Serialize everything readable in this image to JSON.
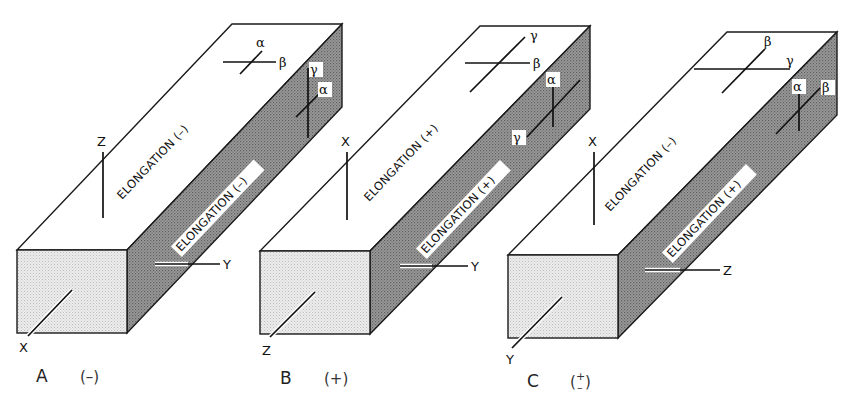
{
  "figure": {
    "colors": {
      "front_face": "#e4e4e4",
      "side_face": "#8c8c8c",
      "top_face": "#ffffff",
      "line": "#1a1a1a"
    },
    "panels": [
      {
        "id": "A",
        "caption": "A",
        "sign": "(–)",
        "front_axis": "X",
        "vertical_axis": "Z",
        "side_axis": "Y",
        "top_face_text": "ELONGATION (–)",
        "side_face_text": "ELONGATION (–)",
        "top_indicatrix": {
          "long_label": "β",
          "short_label": "α"
        },
        "side_indicatrix": {
          "long_label": "γ",
          "short_label": "α"
        }
      },
      {
        "id": "B",
        "caption": "B",
        "sign": "(+)",
        "front_axis": "Z",
        "vertical_axis": "X",
        "side_axis": "Y",
        "top_face_text": "ELONGATION (+)",
        "side_face_text": "ELONGATION (+)",
        "top_indicatrix": {
          "long_label": "γ",
          "short_label": "β"
        },
        "side_indicatrix": {
          "long_label": "γ",
          "short_label": "α"
        }
      },
      {
        "id": "C",
        "caption": "C",
        "sign_top": "+",
        "sign_bottom": "–",
        "front_axis": "Y",
        "vertical_axis": "X",
        "side_axis": "Z",
        "top_face_text": "ELONGATION (–)",
        "side_face_text": "ELONGATION (+)",
        "top_indicatrix": {
          "long_label": "β",
          "short_label": "γ"
        },
        "side_indicatrix": {
          "long_label": "β",
          "short_label": "α"
        }
      }
    ]
  }
}
